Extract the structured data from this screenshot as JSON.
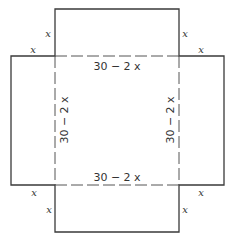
{
  "diagram": {
    "type": "box-net-with-cut-corners",
    "colors": {
      "line": "#3a3a3a",
      "text": "#333333",
      "background": "#ffffff"
    },
    "labels": {
      "side_top": "30 − 2 x",
      "side_bottom": "30 − 2 x",
      "side_left": "30 − 2 x",
      "side_right": "30 − 2 x",
      "corner_x": "x"
    },
    "corner_labels": [
      {
        "id": "top-left-vertical",
        "text": "x"
      },
      {
        "id": "top-left-horizontal",
        "text": "x"
      },
      {
        "id": "top-right-vertical",
        "text": "x"
      },
      {
        "id": "top-right-horizontal",
        "text": "x"
      },
      {
        "id": "bottom-left-horizontal",
        "text": "x"
      },
      {
        "id": "bottom-left-vertical",
        "text": "x"
      },
      {
        "id": "bottom-right-horizontal",
        "text": "x"
      },
      {
        "id": "bottom-right-vertical",
        "text": "x"
      }
    ]
  }
}
